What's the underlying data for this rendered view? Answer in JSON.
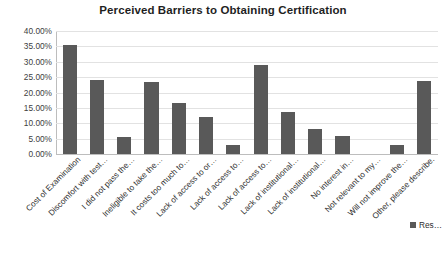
{
  "chart_data": {
    "type": "bar",
    "title": "Perceived Barriers to Obtaining Certification",
    "xlabel": "",
    "ylabel": "",
    "ylim": [
      0,
      0.4
    ],
    "grid": true,
    "legend_position": "bottom-right",
    "value_format": "percent",
    "ytick_labels": [
      "40.00%",
      "35.00%",
      "30.00%",
      "25.00%",
      "20.00%",
      "15.00%",
      "10.00%",
      "5.00%",
      "0.00%"
    ],
    "ytick_values": [
      0.4,
      0.35,
      0.3,
      0.25,
      0.2,
      0.15,
      0.1,
      0.05,
      0.0
    ],
    "categories": [
      "Cost of Examination",
      "Discomfort with test…",
      "I did not pass the…",
      "Ineligible to take the…",
      "It costs too much to…",
      "Lack of access to or…",
      "Lack of access to…",
      "Lack of access to…",
      "Lack of institutional…",
      "Lack of institutional…",
      "No interest in…",
      "Not relevant to my…",
      "Will not improve the…",
      "Other, please describe."
    ],
    "series": [
      {
        "name": "Res…",
        "color": "#595959",
        "values": [
          0.355,
          0.24,
          0.055,
          0.235,
          0.165,
          0.12,
          0.03,
          0.288,
          0.138,
          0.08,
          0.06,
          0.0,
          0.03,
          0.239
        ]
      }
    ],
    "legend": [
      {
        "label": "Res…",
        "color": "#595959"
      }
    ]
  }
}
